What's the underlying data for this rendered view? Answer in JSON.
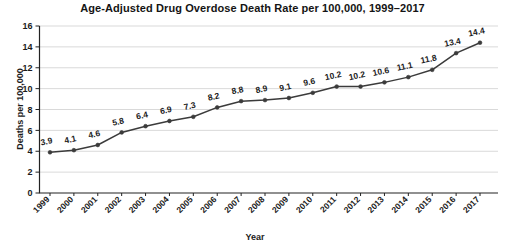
{
  "chart_data": {
    "type": "line",
    "title": "Age-Adjusted Drug Overdose Death Rate per 100,000, 1999–2017",
    "xlabel": "Year",
    "ylabel": "Deaths per 100,000",
    "categories": [
      "1999",
      "2000",
      "2001",
      "2002",
      "2003",
      "2004",
      "2005",
      "2006",
      "2007",
      "2008",
      "2009",
      "2010",
      "2011",
      "2012",
      "2013",
      "2014",
      "2015",
      "2016",
      "2017"
    ],
    "values": [
      3.9,
      4.1,
      4.6,
      5.8,
      6.4,
      6.9,
      7.3,
      8.2,
      8.8,
      8.9,
      9.1,
      9.6,
      10.2,
      10.2,
      10.6,
      11.1,
      11.8,
      13.4,
      14.4
    ],
    "data_labels": [
      "3.9",
      "4.1",
      "4.6",
      "5.8",
      "6.4",
      "6.9",
      "7.3",
      "8.2",
      "8.8",
      "8.9",
      "9.1",
      "9.6",
      "10.2",
      "10.2",
      "10.6",
      "11.1",
      "11.8",
      "13.4",
      "14.4"
    ],
    "ylim": [
      0,
      16
    ],
    "yticks": [
      0,
      2,
      4,
      6,
      8,
      10,
      12,
      14,
      16
    ],
    "ytick_labels": [
      "0",
      "2",
      "4",
      "6",
      "8",
      "10",
      "12",
      "14",
      "16"
    ],
    "grid": "horizontal",
    "legend": "none",
    "series_color": "#3b3b3b",
    "grid_color": "#c9c9c9",
    "axis_color": "#222222",
    "background": "#ffffff",
    "xtick_rotation": 45
  }
}
